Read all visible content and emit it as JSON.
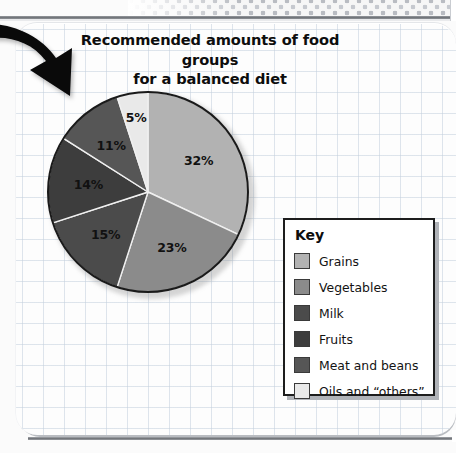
{
  "page": {
    "title_line1": "Recommended amounts of food groups",
    "title_line2": "for a balanced diet",
    "arrow_icon": "curved-down-right-arrow-icon"
  },
  "legend": {
    "heading": "Key",
    "items": [
      {
        "label": "Grains",
        "color": "#b2b2b2"
      },
      {
        "label": "Vegetables",
        "color": "#8b8b8b"
      },
      {
        "label": "Milk",
        "color": "#4b4b4b"
      },
      {
        "label": "Fruits",
        "color": "#3d3d3d"
      },
      {
        "label": "Meat and beans",
        "color": "#565656"
      },
      {
        "label": "Oils and “others”",
        "color": "#e9e9e9"
      }
    ]
  },
  "chart_data": {
    "type": "pie",
    "title": "Recommended amounts of food groups for a balanced diet",
    "legend_position": "right",
    "start_angle_deg": 0,
    "direction": "clockwise",
    "categories": [
      "Grains",
      "Vegetables",
      "Milk",
      "Fruits",
      "Meat and beans",
      "Oils and “others”"
    ],
    "values": [
      32,
      23,
      15,
      14,
      11,
      5
    ],
    "value_labels": [
      "32%",
      "23%",
      "15%",
      "14%",
      "11%",
      "5%"
    ],
    "colors": [
      "#b2b2b2",
      "#8b8b8b",
      "#4b4b4b",
      "#3d3d3d",
      "#565656",
      "#e9e9e9"
    ],
    "units": "percent",
    "total": 100
  }
}
